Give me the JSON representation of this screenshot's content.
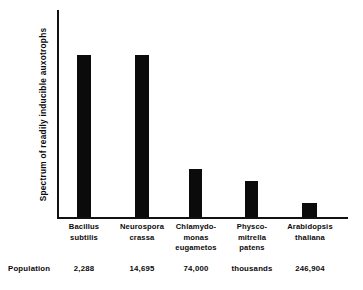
{
  "chart_data": {
    "type": "bar",
    "title": "",
    "xlabel": "",
    "ylabel": "Spectrum of readily inducible auxotrophs",
    "categories": [
      "Bacillus\nsubtilis",
      "Neurospora\ncrassa",
      "Chlamydo-\nmonas\neugametos",
      "Physco-\nmitrella\npatens",
      "Arabidopsis\nthaliana"
    ],
    "values": [
      163,
      163,
      48,
      36,
      14
    ],
    "grid": false,
    "legend": null,
    "axis_has_ticks": false,
    "bar_color": "#0b0b0b",
    "background_color": "#ffffff"
  },
  "row_header": "Population",
  "population_values": [
    "2,288",
    "14,695",
    "74,000",
    "thousands",
    "246,904"
  ],
  "bars": [
    {
      "left": 77,
      "width": 14,
      "top": 55,
      "height": 162
    },
    {
      "left": 135,
      "width": 14,
      "top": 55,
      "height": 162
    },
    {
      "left": 189,
      "width": 13,
      "top": 169,
      "height": 48
    },
    {
      "left": 245,
      "width": 13,
      "top": 181,
      "height": 36
    },
    {
      "left": 302,
      "width": 15,
      "top": 203,
      "height": 14
    }
  ],
  "label_positions": [
    {
      "left": 52,
      "width": 64
    },
    {
      "left": 108,
      "width": 68
    },
    {
      "left": 161,
      "width": 70
    },
    {
      "left": 219,
      "width": 66
    },
    {
      "left": 274,
      "width": 72
    }
  ],
  "pop_positions": [
    {
      "left": 52,
      "width": 64
    },
    {
      "left": 108,
      "width": 68
    },
    {
      "left": 161,
      "width": 70
    },
    {
      "left": 219,
      "width": 66
    },
    {
      "left": 274,
      "width": 72
    }
  ]
}
